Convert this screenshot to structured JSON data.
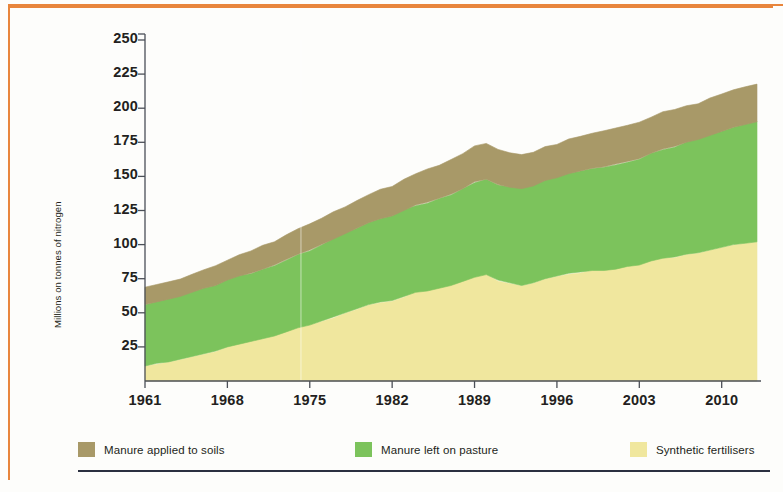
{
  "figure": {
    "border_color": "#e8853c",
    "rule_color": "#2b3040",
    "background": "#fdfdfb"
  },
  "axis": {
    "y_label": "Millions on tonnes of nitrogen",
    "y_ticks": [
      "250",
      "225",
      "200",
      "175",
      "150",
      "125",
      "100",
      "75",
      "50",
      "25"
    ],
    "x_ticks": [
      "1961",
      "1968",
      "1975",
      "1982",
      "1989",
      "1996",
      "2003",
      "2010"
    ]
  },
  "legend": {
    "items": [
      {
        "label": "Manure applied to soils",
        "color": "#a89968"
      },
      {
        "label": "Manure left on pasture",
        "color": "#7cc35c"
      },
      {
        "label": "Synthetic fertilisers",
        "color": "#f0e79e"
      }
    ]
  },
  "chart_data": {
    "type": "area",
    "title": "",
    "subtitle": "",
    "xlabel": "",
    "ylabel": "Millions on tonnes of nitrogen",
    "xlim": [
      1961,
      2013
    ],
    "ylim": [
      0,
      250
    ],
    "yticks": [
      25,
      50,
      75,
      100,
      125,
      150,
      175,
      200,
      225,
      250
    ],
    "xticks": [
      1961,
      1968,
      1975,
      1982,
      1989,
      1996,
      2003,
      2010
    ],
    "grid": false,
    "stacked": true,
    "legend_position": "bottom",
    "x": [
      1961,
      1962,
      1963,
      1964,
      1965,
      1966,
      1967,
      1968,
      1969,
      1970,
      1971,
      1972,
      1973,
      1974,
      1975,
      1976,
      1977,
      1978,
      1979,
      1980,
      1981,
      1982,
      1983,
      1984,
      1985,
      1986,
      1987,
      1988,
      1989,
      1990,
      1991,
      1992,
      1993,
      1994,
      1995,
      1996,
      1997,
      1998,
      1999,
      2000,
      2001,
      2002,
      2003,
      2004,
      2005,
      2006,
      2007,
      2008,
      2009,
      2010,
      2011,
      2012,
      2013
    ],
    "series": [
      {
        "name": "Synthetic fertilisers",
        "color": "#f0e79e",
        "values": [
          11,
          13,
          14,
          16,
          18,
          20,
          22,
          25,
          27,
          29,
          31,
          33,
          36,
          39,
          41,
          44,
          47,
          50,
          53,
          56,
          58,
          59,
          62,
          65,
          66,
          68,
          70,
          73,
          76,
          78,
          74,
          72,
          70,
          72,
          75,
          77,
          79,
          80,
          81,
          81,
          82,
          84,
          85,
          88,
          90,
          91,
          93,
          94,
          96,
          98,
          100,
          101,
          102
        ]
      },
      {
        "name": "Manure left on pasture",
        "color": "#7cc35c",
        "values": [
          45,
          45,
          46,
          46,
          47,
          48,
          48,
          49,
          50,
          50,
          51,
          52,
          53,
          54,
          55,
          56,
          57,
          58,
          59,
          60,
          61,
          62,
          63,
          64,
          65,
          66,
          67,
          68,
          70,
          70,
          70,
          70,
          71,
          71,
          72,
          72,
          73,
          74,
          75,
          76,
          77,
          77,
          78,
          79,
          80,
          81,
          82,
          83,
          84,
          85,
          86,
          87,
          88
        ]
      },
      {
        "name": "Manure applied to soils",
        "color": "#a89968",
        "values": [
          12,
          12,
          13,
          13,
          14,
          14,
          15,
          15,
          16,
          16,
          17,
          17,
          18,
          18,
          19,
          19,
          20,
          20,
          21,
          21,
          22,
          22,
          23,
          23,
          24,
          24,
          25,
          25,
          26,
          26,
          25,
          25,
          25,
          25,
          25,
          25,
          26,
          26,
          26,
          26,
          26,
          26,
          26,
          26,
          27,
          27,
          27,
          27,
          28,
          28,
          28,
          28,
          28
        ]
      }
    ]
  }
}
